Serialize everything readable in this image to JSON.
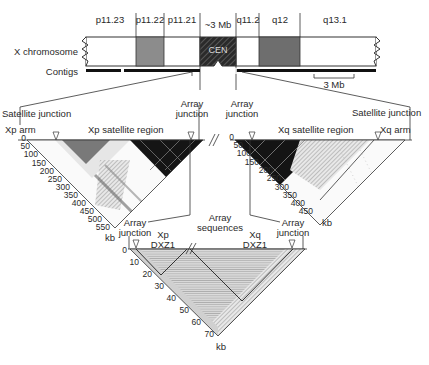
{
  "chromosome": {
    "label": "X chromosome",
    "contigs_label": "Contigs",
    "centromere_label": "CEN",
    "centromere_size": "~3 Mb",
    "scale_bar": "3 Mb",
    "bands": [
      {
        "name": "p11.23",
        "shade": "#ffffff"
      },
      {
        "name": "p11.22",
        "shade": "#8c8c8c"
      },
      {
        "name": "p11.21",
        "shade": "#ffffff"
      },
      {
        "name": "q11.2",
        "shade": "#ffffff"
      },
      {
        "name": "q12",
        "shade": "#6e6e6e"
      },
      {
        "name": "q13.1",
        "shade": "#ffffff"
      }
    ]
  },
  "xp_panel": {
    "left_label": "Xp arm",
    "region_label": "Xp satellite region",
    "left_junction": "Satellite junction",
    "right_junction": "Array junction",
    "axis_unit": "kb",
    "ticks": [
      "0",
      "50",
      "100",
      "150",
      "200",
      "250",
      "300",
      "350",
      "400",
      "450",
      "500",
      "550"
    ]
  },
  "xq_panel": {
    "right_label": "Xq arm",
    "region_label": "Xq satellite region",
    "left_junction": "Array junction",
    "right_junction": "Satellite junction",
    "axis_unit": "kb",
    "ticks": [
      "0",
      "50",
      "100",
      "150",
      "200",
      "250",
      "300",
      "350",
      "400",
      "450"
    ]
  },
  "array_panel": {
    "title": "Array sequences",
    "left_label": "Xp DXZ1",
    "right_label": "Xq DXZ1",
    "left_junction": "Array junction",
    "right_junction": "Array junction",
    "axis_unit": "kb",
    "ticks": [
      "0",
      "10",
      "20",
      "30",
      "40",
      "50",
      "60",
      "70"
    ]
  },
  "colors": {
    "line": "#333333",
    "dark_band": "#6e6e6e",
    "mid_band": "#8c8c8c",
    "heatmap_dark": "#111111",
    "array_fill": "#c8c8c8"
  }
}
